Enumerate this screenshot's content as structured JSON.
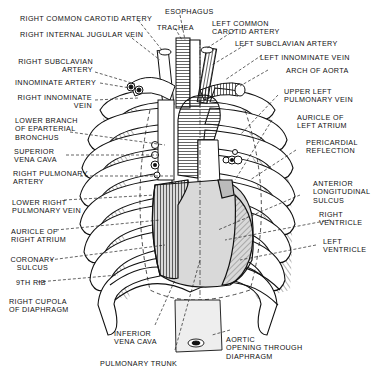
{
  "diagram": {
    "labels_left": [
      {
        "id": "right-common-carotid-artery",
        "lines": [
          "RIGHT COMMON CAROTID ARTERY"
        ]
      },
      {
        "id": "right-internal-jugular-vein",
        "lines": [
          "RIGHT INTERNAL JUGULAR VEIN"
        ]
      },
      {
        "id": "right-subclavian-artery",
        "lines": [
          "RIGHT SUBCLAVIAN",
          "ARTERY"
        ]
      },
      {
        "id": "innominate-artery",
        "lines": [
          "INNOMINATE ARTERY"
        ]
      },
      {
        "id": "right-innominate-vein",
        "lines": [
          "RIGHT INNOMINATE",
          "VEIN"
        ]
      },
      {
        "id": "lower-branch-eparterial-bronchus",
        "lines": [
          "LOWER BRANCH",
          "OF EPARTERIAL",
          "BRONCHUS"
        ]
      },
      {
        "id": "superior-vena-cava",
        "lines": [
          "SUPERIOR",
          "VENA CAVA"
        ]
      },
      {
        "id": "right-pulmonary-artery",
        "lines": [
          "RIGHT PULMONARY",
          "ARTERY"
        ]
      },
      {
        "id": "lower-right-pulmonary-vein",
        "lines": [
          "LOWER RIGHT",
          "PULMONARY VEIN"
        ]
      },
      {
        "id": "auricle-of-right-atrium",
        "lines": [
          "AURICLE OF",
          "RIGHT ATRIUM"
        ]
      },
      {
        "id": "coronary-sulcus",
        "lines": [
          "CORONARY",
          "SULCUS"
        ]
      },
      {
        "id": "ninth-rib",
        "lines": [
          "9TH RIB"
        ]
      },
      {
        "id": "right-cupola-of-diaphragm",
        "lines": [
          "RIGHT CUPOLA",
          "OF DIAPHRAGM"
        ]
      }
    ],
    "labels_top": [
      {
        "id": "esophagus",
        "lines": [
          "ESOPHAGUS"
        ]
      },
      {
        "id": "trachea",
        "lines": [
          "TRACHEA"
        ]
      },
      {
        "id": "left-common-carotid-artery",
        "lines": [
          "LEFT COMMON",
          "CAROTID ARTERY"
        ]
      }
    ],
    "labels_right": [
      {
        "id": "left-subclavian-artery",
        "lines": [
          "LEFT SUBCLAVIAN ARTERY"
        ]
      },
      {
        "id": "left-innominate-vein",
        "lines": [
          "LEFT INNOMINATE VEIN"
        ]
      },
      {
        "id": "arch-of-aorta",
        "lines": [
          "ARCH OF AORTA"
        ]
      },
      {
        "id": "upper-left-pulmonary-vein",
        "lines": [
          "UPPER LEFT",
          "PULMONARY VEIN"
        ]
      },
      {
        "id": "auricle-of-left-atrium",
        "lines": [
          "AURICLE OF",
          "LEFT ATRIUM"
        ]
      },
      {
        "id": "pericardial-reflection",
        "lines": [
          "PERICARDIAL",
          "REFLECTION"
        ]
      },
      {
        "id": "anterior-longitudinal-sulcus",
        "lines": [
          "ANTERIOR",
          "LONGITUDINAL",
          "SULCUS"
        ]
      },
      {
        "id": "right-ventricle",
        "lines": [
          "RIGHT",
          "VENTRICLE"
        ]
      },
      {
        "id": "left-ventricle",
        "lines": [
          "LEFT",
          "VENTRICLE"
        ]
      }
    ],
    "labels_bottom": [
      {
        "id": "inferior-vena-cava",
        "lines": [
          "INFERIOR",
          "VENA CAVA"
        ]
      },
      {
        "id": "pulmonary-trunk",
        "lines": [
          "PULMONARY TRUNK"
        ]
      },
      {
        "id": "aortic-opening-through-diaphragm",
        "lines": [
          "AORTIC",
          "OPENING THROUGH",
          "DIAPHRAGM"
        ]
      }
    ]
  }
}
